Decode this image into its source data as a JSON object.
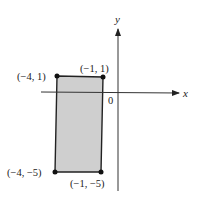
{
  "diagram": {
    "axes": {
      "x_label": "x",
      "y_label": "y",
      "origin_label": "0"
    },
    "rectangle": {
      "fill": "#cfcfcf",
      "stroke": "#222222",
      "vertices": [
        {
          "label": "(−4, 1)",
          "x": -4,
          "y": 1
        },
        {
          "label": "(−1, 1)",
          "x": -1,
          "y": 1
        },
        {
          "label": "(−1, −5)",
          "x": -1,
          "y": -5
        },
        {
          "label": "(−4, −5)",
          "x": -4,
          "y": -5
        }
      ]
    }
  }
}
